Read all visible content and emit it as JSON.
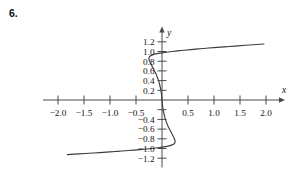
{
  "figure": {
    "problem_number": "6.",
    "background_color": "#ffffff",
    "axis_color": "#4a4a4a",
    "curve_color": "#3d3d3d",
    "text_color": "#131313"
  },
  "chart_data": {
    "type": "line",
    "title": "",
    "subtitle": "",
    "xlabel": "x",
    "ylabel": "y",
    "xlim": [
      -2.25,
      2.25
    ],
    "ylim": [
      -1.35,
      1.35
    ],
    "grid": false,
    "legend": null,
    "legend_position": "none",
    "x_ticks": [
      -2.0,
      -1.5,
      -1.0,
      -0.5,
      0.5,
      1.0,
      1.5,
      2.0
    ],
    "x_tick_labels": [
      "-2.0",
      "-1.5",
      "-1.0",
      "-0.5",
      "0.5",
      "1.0",
      "1.5",
      "2.0"
    ],
    "y_ticks": [
      1.2,
      1.0,
      0.8,
      0.6,
      0.4,
      0.2,
      -0.4,
      -0.6,
      -0.8,
      -1.0,
      -1.2
    ],
    "y_tick_labels": [
      "1.2",
      "1.0",
      "0.8",
      "0.6",
      "0.4",
      "0.2",
      "-0.4",
      "-0.6",
      "-0.8",
      "-1.0",
      "-1.2"
    ],
    "y_ticks_unlabeled": [
      -0.2
    ],
    "annotations": [],
    "series": [
      {
        "name": "curve",
        "comment": "Single continuous point-symmetric curve: an S-shape through the origin with small cusp-like loops near y = +0.9 (left of axis) and y = -0.9 (right of axis), then two nearly-horizontal branches leaving toward x = +2 at y ~ 1.15 and x = -1.8 at y ~ -1.12.",
        "points": [
          [
            -1.82,
            -1.125
          ],
          [
            -1.6,
            -1.11
          ],
          [
            -1.4,
            -1.098
          ],
          [
            -1.2,
            -1.085
          ],
          [
            -1.0,
            -1.07
          ],
          [
            -0.85,
            -1.058
          ],
          [
            -0.7,
            -1.046
          ],
          [
            -0.55,
            -1.034
          ],
          [
            -0.42,
            -1.022
          ],
          [
            -0.3,
            -1.01
          ],
          [
            -0.2,
            -1.0
          ],
          [
            -0.12,
            -0.99
          ],
          [
            -0.05,
            -0.98
          ],
          [
            0.0,
            -0.972
          ],
          [
            0.06,
            -0.962
          ],
          [
            0.12,
            -0.95
          ],
          [
            0.17,
            -0.936
          ],
          [
            0.21,
            -0.92
          ],
          [
            0.235,
            -0.9
          ],
          [
            0.248,
            -0.878
          ],
          [
            0.252,
            -0.855
          ],
          [
            0.248,
            -0.83
          ],
          [
            0.238,
            -0.8
          ],
          [
            0.222,
            -0.76
          ],
          [
            0.2,
            -0.715
          ],
          [
            0.175,
            -0.665
          ],
          [
            0.148,
            -0.61
          ],
          [
            0.12,
            -0.55
          ],
          [
            0.095,
            -0.485
          ],
          [
            0.072,
            -0.42
          ],
          [
            0.053,
            -0.35
          ],
          [
            0.036,
            -0.278
          ],
          [
            0.022,
            -0.205
          ],
          [
            0.011,
            -0.13
          ],
          [
            0.004,
            -0.06
          ],
          [
            0.0,
            0.0
          ],
          [
            -0.004,
            0.06
          ],
          [
            -0.011,
            0.13
          ],
          [
            -0.022,
            0.205
          ],
          [
            -0.036,
            0.278
          ],
          [
            -0.053,
            0.35
          ],
          [
            -0.072,
            0.42
          ],
          [
            -0.095,
            0.485
          ],
          [
            -0.12,
            0.55
          ],
          [
            -0.148,
            0.61
          ],
          [
            -0.175,
            0.665
          ],
          [
            -0.2,
            0.715
          ],
          [
            -0.222,
            0.76
          ],
          [
            -0.238,
            0.8
          ],
          [
            -0.248,
            0.83
          ],
          [
            -0.252,
            0.855
          ],
          [
            -0.248,
            0.878
          ],
          [
            -0.235,
            0.9
          ],
          [
            -0.21,
            0.92
          ],
          [
            -0.17,
            0.936
          ],
          [
            -0.12,
            0.95
          ],
          [
            -0.06,
            0.962
          ],
          [
            0.0,
            0.972
          ],
          [
            0.05,
            0.98
          ],
          [
            0.12,
            0.99
          ],
          [
            0.2,
            1.0
          ],
          [
            0.3,
            1.012
          ],
          [
            0.42,
            1.026
          ],
          [
            0.55,
            1.04
          ],
          [
            0.7,
            1.054
          ],
          [
            0.85,
            1.068
          ],
          [
            1.0,
            1.08
          ],
          [
            1.2,
            1.096
          ],
          [
            1.4,
            1.112
          ],
          [
            1.6,
            1.128
          ],
          [
            1.82,
            1.145
          ],
          [
            1.96,
            1.155
          ]
        ]
      }
    ]
  }
}
